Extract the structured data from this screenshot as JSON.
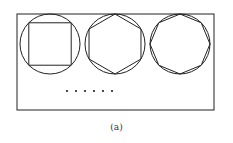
{
  "figure": {
    "caption": "(a)",
    "frame": {
      "x": 17,
      "y": 14,
      "w": 197,
      "h": 96
    },
    "stroke": "#222222",
    "shapes": [
      {
        "name": "circle-with-square",
        "cx": 50,
        "cy": 44,
        "r": 30,
        "sides": 4
      },
      {
        "name": "circle-with-hexagon",
        "cx": 115,
        "cy": 44,
        "r": 30,
        "sides": 6
      },
      {
        "name": "circle-with-octagon",
        "cx": 180,
        "cy": 44,
        "r": 30,
        "sides": 8
      }
    ],
    "ellipsis_dots": {
      "count": 6,
      "x_start": 67,
      "spacing": 9,
      "y": 91
    }
  }
}
